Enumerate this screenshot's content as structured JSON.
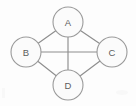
{
  "figure": {
    "background_color": "#fdfdfd",
    "width": 136,
    "height": 106
  },
  "style": {
    "node_fill": "#fbfbfb",
    "node_stroke": "#9a9a9a",
    "edge_stroke": "#8e8e8e",
    "label_color": "#5d5d5d",
    "node_radius": 15
  },
  "chart_data": {
    "type": "diagram",
    "graph_type": "undirected",
    "title": "",
    "nodes": [
      {
        "id": "A",
        "label": "A",
        "x": 68,
        "y": 22
      },
      {
        "id": "B",
        "label": "B",
        "x": 26,
        "y": 52
      },
      {
        "id": "C",
        "label": "C",
        "x": 112,
        "y": 52
      },
      {
        "id": "D",
        "label": "D",
        "x": 68,
        "y": 85
      }
    ],
    "edges": [
      {
        "id": "A-B",
        "source": "A",
        "target": "B",
        "x1": 56,
        "y1": 32,
        "x2": 37,
        "y2": 43
      },
      {
        "id": "A-C",
        "source": "A",
        "target": "C",
        "x1": 80,
        "y1": 32,
        "x2": 101,
        "y2": 43
      },
      {
        "id": "A-D",
        "source": "A",
        "target": "D",
        "x1": 68,
        "y1": 37,
        "x2": 68,
        "y2": 70
      },
      {
        "id": "B-C",
        "source": "B",
        "target": "C",
        "x1": 41,
        "y1": 52,
        "x2": 97,
        "y2": 52
      },
      {
        "id": "B-D",
        "source": "B",
        "target": "D",
        "x1": 36,
        "y1": 62,
        "x2": 56,
        "y2": 75
      },
      {
        "id": "C-D",
        "source": "C",
        "target": "D",
        "x1": 101,
        "y1": 62,
        "x2": 81,
        "y2": 75
      }
    ],
    "node_count": 4,
    "edge_count": 6
  }
}
